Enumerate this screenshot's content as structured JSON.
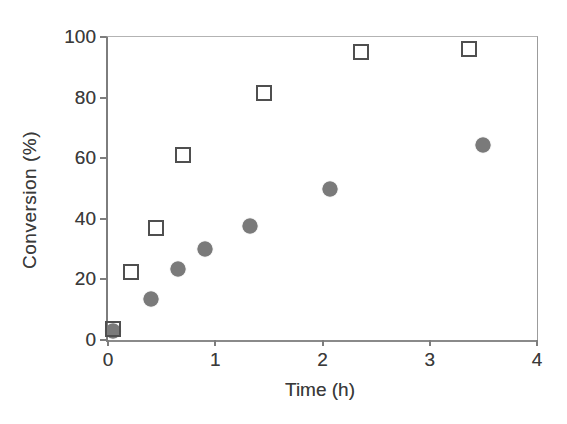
{
  "figure": {
    "background_color": "#ffffff",
    "text_color": "#3a3a3a",
    "axis_color": "#8a8a8a"
  },
  "chart_data": {
    "type": "scatter",
    "title": "",
    "xlabel": "Time (h)",
    "ylabel": "Conversion (%)",
    "xlim": [
      0,
      4
    ],
    "ylim": [
      0,
      100
    ],
    "x_ticks": [
      0,
      1,
      2,
      3,
      4
    ],
    "y_ticks": [
      0,
      20,
      40,
      60,
      80,
      100
    ],
    "grid": false,
    "legend_position": "none",
    "series": [
      {
        "name": "filled-circles",
        "marker": "circle",
        "fill_color": "#7a7a7a",
        "stroke_color": "#6f6f6f",
        "points": [
          {
            "x": 0.05,
            "y": 3.0
          },
          {
            "x": 0.4,
            "y": 13.5
          },
          {
            "x": 0.65,
            "y": 23.5
          },
          {
            "x": 0.9,
            "y": 30.0
          },
          {
            "x": 1.32,
            "y": 37.5
          },
          {
            "x": 2.07,
            "y": 50.0
          },
          {
            "x": 3.5,
            "y": 64.5
          }
        ]
      },
      {
        "name": "open-squares",
        "marker": "square",
        "fill_color": "transparent",
        "stroke_color": "#4f4f4f",
        "points": [
          {
            "x": 0.05,
            "y": 3.5
          },
          {
            "x": 0.21,
            "y": 22.5
          },
          {
            "x": 0.45,
            "y": 37.0
          },
          {
            "x": 0.7,
            "y": 61.0
          },
          {
            "x": 1.45,
            "y": 81.5
          },
          {
            "x": 2.36,
            "y": 95.0
          },
          {
            "x": 3.37,
            "y": 96.0
          }
        ]
      }
    ]
  }
}
